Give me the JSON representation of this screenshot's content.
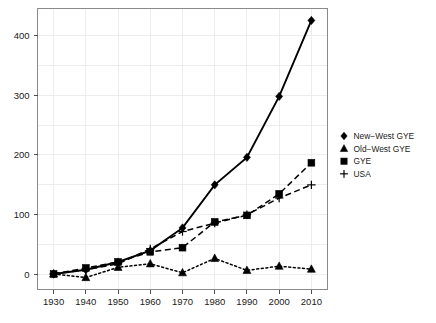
{
  "chart_data": {
    "type": "line",
    "title": "",
    "subtitle": "",
    "xlabel": "",
    "ylabel": "",
    "x": [
      1930,
      1940,
      1950,
      1960,
      1970,
      1980,
      1990,
      2000,
      2010
    ],
    "xtick_labels": [
      "1930",
      "1940",
      "1950",
      "1960",
      "1970",
      "1980",
      "1990",
      "2000",
      "2010"
    ],
    "ytick_labels": [
      "0",
      "100",
      "200",
      "300",
      "400"
    ],
    "yticks": [
      0,
      100,
      200,
      300,
      400
    ],
    "xlim": [
      1925,
      2015
    ],
    "ylim": [
      -25,
      445
    ],
    "grid": true,
    "legend_position": "right",
    "series": [
      {
        "name": "New−West GYE",
        "marker": "diamond",
        "linestyle": "solid",
        "values": [
          1,
          8,
          21,
          40,
          78,
          150,
          196,
          298,
          425
        ]
      },
      {
        "name": "Old−West GYE",
        "marker": "triangle",
        "linestyle": "dotted",
        "values": [
          1,
          -5,
          12,
          18,
          3,
          27,
          7,
          14,
          9
        ]
      },
      {
        "name": "GYE",
        "marker": "square",
        "linestyle": "dashed",
        "values": [
          1,
          11,
          21,
          38,
          45,
          88,
          99,
          135,
          187
        ]
      },
      {
        "name": "USA",
        "marker": "plus",
        "linestyle": "dashed",
        "values": [
          1,
          8,
          18,
          43,
          72,
          86,
          100,
          128,
          150
        ]
      }
    ]
  },
  "legend": {
    "entries": [
      {
        "label": "New−West GYE",
        "marker": "diamond-marker"
      },
      {
        "label": "Old−West GYE",
        "marker": "triangle-marker"
      },
      {
        "label": "GYE",
        "marker": "square-marker"
      },
      {
        "label": "USA",
        "marker": "plus-marker"
      }
    ]
  },
  "colors": {
    "series": "#000000",
    "grid": "#e9e9e9",
    "frame": "#8a8a8a",
    "text": "#1a1a1a",
    "background": "#ffffff"
  }
}
